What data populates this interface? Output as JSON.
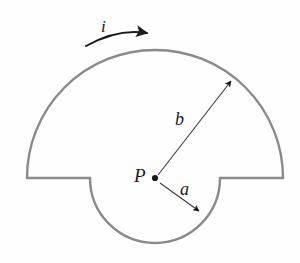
{
  "figure": {
    "type": "physics-diagram",
    "background_color": "#fefefe",
    "wire_color": "#8a8a8a",
    "annotation_color": "#1a1a1a",
    "labels": {
      "current": "i",
      "outer_radius": "b",
      "inner_radius": "a",
      "center_point": "P"
    },
    "geometry": {
      "center": {
        "x": 155,
        "y": 178
      },
      "outer_radius_px": 128,
      "inner_radius_px": 65,
      "outer_arc_span_deg": 180,
      "inner_arc_span_deg": 180,
      "wire_stroke_width_px": 2.4,
      "left_corner": {
        "x": 27,
        "y": 178
      },
      "right_corner": {
        "x": 283,
        "y": 178
      },
      "inner_left": {
        "x": 90,
        "y": 178
      },
      "inner_right": {
        "x": 220,
        "y": 178
      },
      "outer_arc_top": {
        "x": 155,
        "y": 50
      },
      "inner_arc_bottom": {
        "x": 155,
        "y": 243
      }
    },
    "arrows": {
      "current_arrow": {
        "start": {
          "x": 86,
          "y": 46
        },
        "end": {
          "x": 150,
          "y": 32
        },
        "curved": true,
        "direction": "clockwise"
      },
      "radius_b_arrow": {
        "start": {
          "x": 158,
          "y": 175
        },
        "end": {
          "x": 233,
          "y": 79
        }
      },
      "radius_a_arrow": {
        "start": {
          "x": 160,
          "y": 183
        },
        "end": {
          "x": 201,
          "y": 213
        }
      }
    }
  }
}
